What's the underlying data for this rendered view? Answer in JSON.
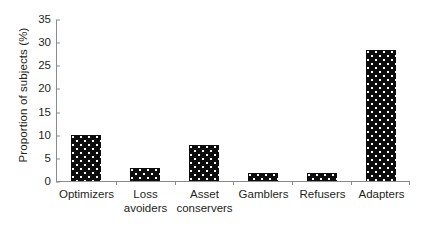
{
  "chart_data": {
    "type": "bar",
    "title": "",
    "subtitle": "",
    "xlabel": "",
    "ylabel": "Proportion of subjects (%)",
    "categories": [
      "Optimizers",
      "Loss avoiders",
      "Asset conservers",
      "Gamblers",
      "Refusers",
      "Adapters"
    ],
    "values": [
      10.0,
      2.9,
      7.8,
      1.8,
      1.7,
      28.5
    ],
    "ylim": [
      0,
      35
    ],
    "yticks": [
      0,
      5,
      10,
      15,
      20,
      25,
      30,
      35
    ],
    "ytick_labels": [
      "0",
      "5",
      "10",
      "15",
      "20",
      "25",
      "30",
      "35"
    ],
    "grid": false,
    "legend": false,
    "legend_position": "none",
    "bar_color": "#0d0d0d",
    "bar_pattern": "white-dots",
    "axis_color": "#8a8a8a",
    "text_color": "#231f20",
    "background_color": "#ffffff"
  },
  "axis": {
    "y_title": "Proportion of subjects (%)",
    "x_category_labels": [
      "Optimizers",
      "Loss\navoiders",
      "Asset\nconservers",
      "Gamblers",
      "Refusers",
      "Adapters"
    ]
  }
}
